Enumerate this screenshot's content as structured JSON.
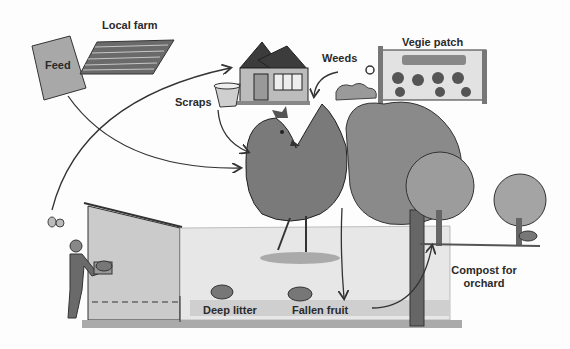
{
  "labels": {
    "local_farm": "Local farm",
    "feed": "Feed",
    "scraps": "Scraps",
    "weeds": "Weeds",
    "vegie_patch": "Vegie patch",
    "deep_litter": "Deep litter",
    "fallen_fruit": "Fallen fruit",
    "compost_line1": "Compost for",
    "compost_line2": "orchard"
  },
  "flows": [
    {
      "from": "Feed",
      "to": "Chicken"
    },
    {
      "from": "Eggs",
      "to": "House"
    },
    {
      "from": "Scraps",
      "to": "Chicken"
    },
    {
      "from": "Weeds",
      "to": "Chicken"
    },
    {
      "from": "Orchard",
      "to": "Fallen fruit"
    },
    {
      "from": "Coop",
      "to": "Compost for orchard"
    }
  ],
  "colors": {
    "ink": "#2a2a2a",
    "wash_dark": "#6e6e6e",
    "wash_mid": "#9a9a9a",
    "wash_light": "#c9c9c9",
    "background": "#fdfdfd"
  }
}
